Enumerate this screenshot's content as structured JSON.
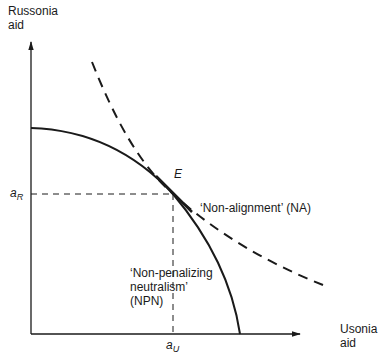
{
  "diagram": {
    "y_axis_label": [
      "Russonia",
      "aid"
    ],
    "x_axis_label": [
      "Usonia",
      "aid"
    ],
    "point_label": "E",
    "a_R": {
      "base": "a",
      "sub": "R"
    },
    "a_U": {
      "base": "a",
      "sub": "U"
    },
    "na_label": "‘Non-alignment’ (NA)",
    "npn_label": [
      "‘Non-penalizing",
      "neutralism’",
      "(NPN)"
    ],
    "colors": {
      "ink": "#1a1a1a",
      "background": "#ffffff"
    }
  }
}
